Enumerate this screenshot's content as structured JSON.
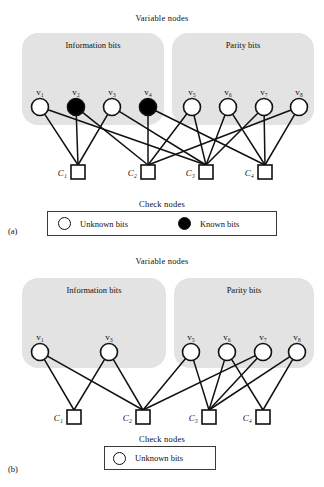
{
  "figure": {
    "type": "tanner-graph",
    "panels": [
      {
        "letter": "(a)",
        "top_title": "Variable nodes",
        "bottom_title": "Check nodes",
        "group_labels": {
          "information": "Information bits",
          "parity": "Parity bits"
        },
        "variable_nodes": [
          {
            "label": "v₁",
            "state": "unknown",
            "cx": 40,
            "cy": 107
          },
          {
            "label": "v₂",
            "state": "known",
            "cx": 76,
            "cy": 107
          },
          {
            "label": "v₃",
            "state": "unknown",
            "cx": 112,
            "cy": 107
          },
          {
            "label": "v₄",
            "state": "known",
            "cx": 148,
            "cy": 107
          },
          {
            "label": "v₅",
            "state": "unknown",
            "cx": 192,
            "cy": 107
          },
          {
            "label": "v₆",
            "state": "unknown",
            "cx": 228,
            "cy": 107
          },
          {
            "label": "v₇",
            "state": "unknown",
            "cx": 264,
            "cy": 107
          },
          {
            "label": "v₈",
            "state": "unknown",
            "cx": 299,
            "cy": 107
          }
        ],
        "check_nodes": [
          {
            "label": "C₁",
            "cx": 78,
            "cy": 172
          },
          {
            "label": "C₂",
            "cx": 148,
            "cy": 172
          },
          {
            "label": "C₃",
            "cx": 206,
            "cy": 172
          },
          {
            "label": "C₄",
            "cx": 265,
            "cy": 172
          }
        ],
        "edges": [
          [
            0,
            0
          ],
          [
            0,
            2
          ],
          [
            1,
            0
          ],
          [
            1,
            1
          ],
          [
            2,
            0
          ],
          [
            2,
            2
          ],
          [
            3,
            1
          ],
          [
            3,
            3
          ],
          [
            4,
            1
          ],
          [
            4,
            2
          ],
          [
            5,
            2
          ],
          [
            5,
            3
          ],
          [
            6,
            2
          ],
          [
            6,
            3
          ],
          [
            7,
            1
          ],
          [
            7,
            3
          ]
        ],
        "legend": [
          {
            "swatch": "hollow",
            "label": "Unknown bits"
          },
          {
            "swatch": "filled",
            "label": "Known bits"
          }
        ]
      },
      {
        "letter": "(b)",
        "top_title": "Variable nodes",
        "bottom_title": "Check nodes",
        "group_labels": {
          "information": "Information bits",
          "parity": "Parity bits"
        },
        "variable_nodes": [
          {
            "label": "v₁",
            "state": "unknown",
            "cx": 40,
            "cy": 107
          },
          {
            "label": "v₃",
            "state": "unknown",
            "cx": 109,
            "cy": 107
          },
          {
            "label": "v₅",
            "state": "unknown",
            "cx": 191,
            "cy": 107
          },
          {
            "label": "v₆",
            "state": "unknown",
            "cx": 227,
            "cy": 107
          },
          {
            "label": "v₇",
            "state": "unknown",
            "cx": 263,
            "cy": 107
          },
          {
            "label": "v₈",
            "state": "unknown",
            "cx": 297,
            "cy": 107
          }
        ],
        "check_nodes": [
          {
            "label": "C₁",
            "cx": 74,
            "cy": 172
          },
          {
            "label": "C₂",
            "cx": 143,
            "cy": 172
          },
          {
            "label": "C₃",
            "cx": 209,
            "cy": 172
          },
          {
            "label": "C₄",
            "cx": 263,
            "cy": 172
          }
        ],
        "edges": [
          [
            0,
            0
          ],
          [
            0,
            1
          ],
          [
            1,
            0
          ],
          [
            1,
            1
          ],
          [
            2,
            1
          ],
          [
            2,
            2
          ],
          [
            3,
            2
          ],
          [
            3,
            3
          ],
          [
            4,
            1
          ],
          [
            4,
            2
          ],
          [
            5,
            2
          ],
          [
            5,
            3
          ]
        ],
        "legend": [
          {
            "swatch": "hollow",
            "label": "Unknown bits"
          }
        ]
      }
    ],
    "colors": {
      "group_fill": "#e3e3e3",
      "node_stroke": "#111111",
      "node_fill_unknown": "#ffffff",
      "node_fill_known": "#000000",
      "edge": "#111111"
    }
  }
}
